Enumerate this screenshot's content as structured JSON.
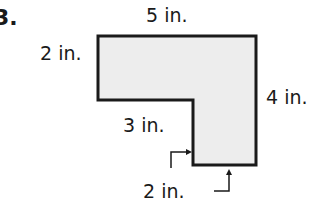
{
  "problem": {
    "number": "3."
  },
  "figure": {
    "shape": "L-shaped polygon",
    "fill": "#ededed",
    "stroke": "#1a1a1a",
    "labels": {
      "top": "5 in.",
      "left": "2 in.",
      "right": "4 in.",
      "inner_horizontal": "3 in.",
      "bottom": "2 in."
    }
  }
}
